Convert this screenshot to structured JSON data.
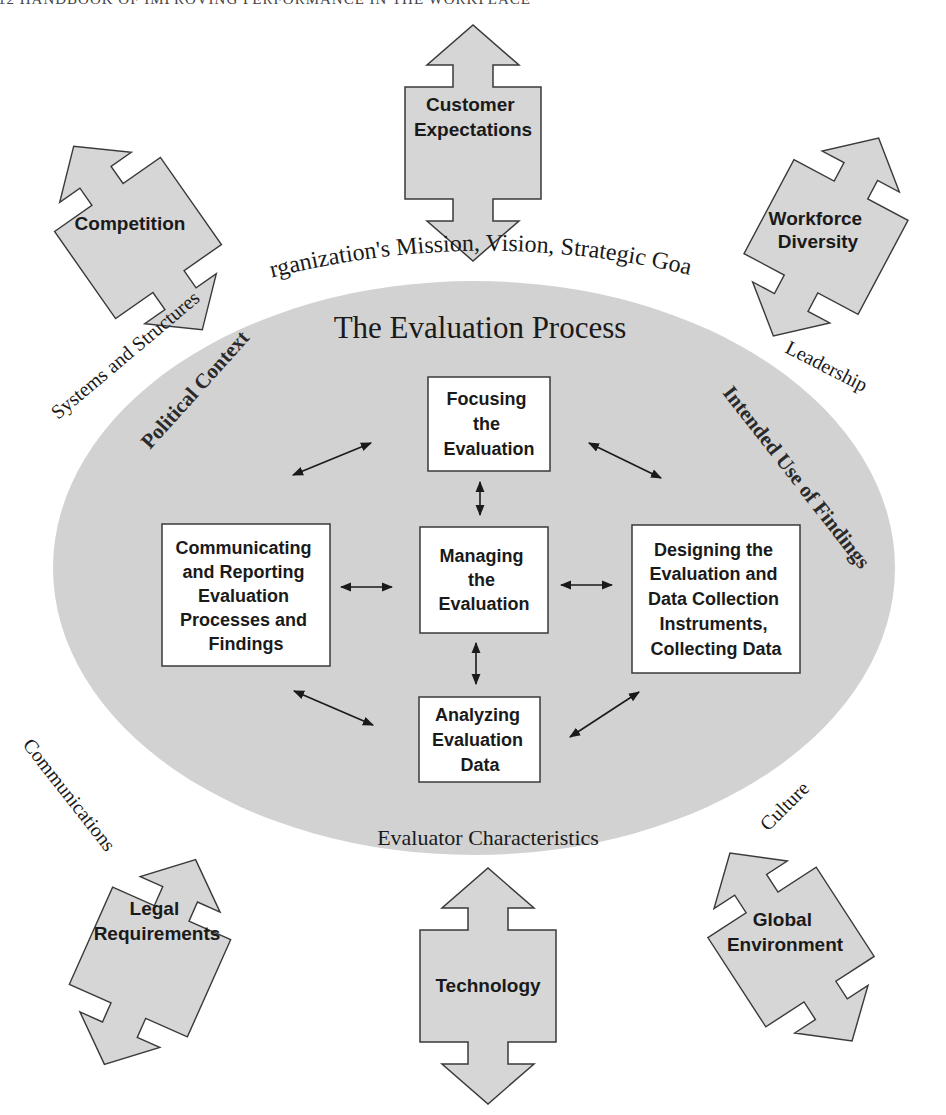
{
  "running_head": "12   HANDBOOK OF IMPROVING PERFORMANCE IN THE WORKPLACE",
  "colors": {
    "ellipse_fill": "#d2d2d2",
    "arrow_fill": "#d6d6d6",
    "stroke": "#3a3a3a",
    "box_fill": "#ffffff",
    "text": "#1a1a1a"
  },
  "outer_forces": {
    "customer_expectations": [
      "Customer",
      "Expectations"
    ],
    "competition": [
      "Competition"
    ],
    "workforce_diversity": [
      "Workforce",
      "Diversity"
    ],
    "legal_requirements": [
      "Legal",
      "Requirements"
    ],
    "technology": [
      "Technology"
    ],
    "global_environment": [
      "Global",
      "Environment"
    ]
  },
  "ring_labels": {
    "mission": "Organization's Mission, Vision, Strategic Goals",
    "systems": "Systems and Structures",
    "leadership": "Leadership",
    "communications": "Communications",
    "culture": "Culture"
  },
  "ellipse": {
    "title": "The Evaluation Process",
    "political_context": "Political Context",
    "intended_use": "Intended Use of Findings",
    "evaluator_characteristics": "Evaluator Characteristics"
  },
  "process_boxes": {
    "focusing": [
      "Focusing",
      "the",
      "Evaluation"
    ],
    "managing": [
      "Managing",
      "the",
      "Evaluation"
    ],
    "communicating": [
      "Communicating",
      "and Reporting",
      "Evaluation",
      "Processes and",
      "Findings"
    ],
    "designing": [
      "Designing the",
      "Evaluation and",
      "Data Collection",
      "Instruments,",
      "Collecting Data"
    ],
    "analyzing": [
      "Analyzing",
      "Evaluation",
      "Data"
    ]
  }
}
